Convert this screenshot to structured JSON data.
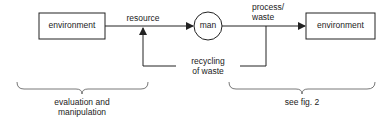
{
  "diagram": {
    "nodes": {
      "env_left": {
        "label": "environment"
      },
      "man": {
        "label": "man"
      },
      "env_right": {
        "label": "environment"
      }
    },
    "edges": {
      "resource": {
        "label": "resource"
      },
      "process": {
        "label_line1": "process/",
        "label_line2": "waste"
      },
      "recycling": {
        "label_line1": "recycling",
        "label_line2": "of waste"
      }
    },
    "braces": {
      "left": {
        "label_line1": "evaluation and",
        "label_line2": "manipulation"
      },
      "right": {
        "label": "see fig. 2"
      }
    },
    "colors": {
      "stroke": "#222222",
      "background": "#ffffff"
    }
  }
}
